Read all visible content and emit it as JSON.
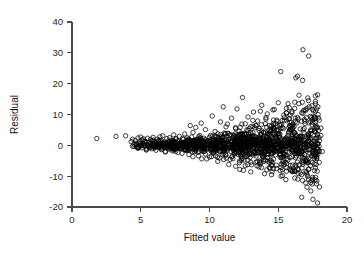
{
  "figure": {
    "background_color": "#ffffff",
    "marker_color": "#000000",
    "axis_color": "#4a4a4a",
    "marker_shape": "open-circle"
  },
  "axis_labels": {
    "x_title": "Fitted value",
    "y_title": "Residual"
  },
  "ticks": {
    "x": [
      "0",
      "5",
      "10",
      "15",
      "20"
    ],
    "y": [
      "40",
      "30",
      "20",
      "10",
      "0",
      "-10",
      "-20"
    ]
  },
  "chart_data": {
    "type": "scatter",
    "title": "",
    "xlabel": "Fitted value",
    "ylabel": "Residual",
    "xlim": [
      0,
      20
    ],
    "ylim": [
      -20,
      40
    ],
    "xticks": [
      0,
      5,
      10,
      15,
      20
    ],
    "yticks": [
      -20,
      -10,
      0,
      10,
      20,
      30,
      40
    ],
    "grid": false,
    "legend": "none",
    "marker": "open-circle",
    "marker_size": 2.2,
    "n_points": 1400,
    "points": [
      [
        1.8,
        2.2
      ],
      [
        3.2,
        2.9
      ],
      [
        3.9,
        3.1
      ],
      [
        4.3,
        1.2
      ],
      [
        4.4,
        2.0
      ],
      [
        4.5,
        -0.4
      ],
      [
        4.6,
        1.6
      ],
      [
        4.7,
        0.4
      ],
      [
        4.8,
        2.4
      ],
      [
        4.8,
        -1.0
      ],
      [
        4.9,
        1.1
      ],
      [
        5.0,
        0.2
      ],
      [
        5.0,
        2.7
      ],
      [
        5.1,
        -0.8
      ],
      [
        5.1,
        1.8
      ],
      [
        5.2,
        0.6
      ],
      [
        5.2,
        2.1
      ],
      [
        5.3,
        -0.2
      ],
      [
        5.3,
        1.4
      ],
      [
        5.4,
        0.9
      ],
      [
        5.4,
        -1.3
      ],
      [
        5.5,
        2.3
      ],
      [
        5.5,
        0.1
      ],
      [
        5.6,
        1.0
      ],
      [
        5.6,
        -0.6
      ],
      [
        5.7,
        1.9
      ],
      [
        5.7,
        0.5
      ],
      [
        5.8,
        -1.1
      ],
      [
        5.8,
        1.5
      ],
      [
        5.9,
        0.3
      ],
      [
        5.9,
        2.6
      ],
      [
        6.0,
        -0.9
      ],
      [
        6.0,
        1.2
      ],
      [
        6.1,
        0.7
      ],
      [
        6.1,
        -1.6
      ],
      [
        6.2,
        2.0
      ],
      [
        6.2,
        0.0
      ],
      [
        6.3,
        1.3
      ],
      [
        6.3,
        -0.5
      ],
      [
        6.4,
        2.8
      ],
      [
        6.4,
        0.8
      ],
      [
        6.5,
        -1.4
      ],
      [
        6.5,
        1.6
      ],
      [
        6.6,
        0.2
      ],
      [
        6.6,
        3.1
      ],
      [
        6.7,
        -0.7
      ],
      [
        6.7,
        1.1
      ],
      [
        6.8,
        0.4
      ],
      [
        6.8,
        -2.0
      ],
      [
        6.9,
        2.2
      ],
      [
        6.9,
        0.6
      ],
      [
        7.0,
        1.4
      ],
      [
        7.0,
        -1.2
      ],
      [
        7.1,
        0.1
      ],
      [
        7.1,
        2.5
      ],
      [
        7.2,
        -0.3
      ],
      [
        7.2,
        1.7
      ],
      [
        7.3,
        0.9
      ],
      [
        7.3,
        -1.8
      ],
      [
        7.4,
        3.4
      ],
      [
        7.4,
        0.3
      ],
      [
        7.5,
        1.2
      ],
      [
        7.5,
        -0.8
      ],
      [
        7.6,
        2.1
      ],
      [
        7.6,
        0.5
      ],
      [
        7.7,
        -2.3
      ],
      [
        7.7,
        1.5
      ],
      [
        7.8,
        0.0
      ],
      [
        7.8,
        2.9
      ],
      [
        7.9,
        -1.0
      ],
      [
        7.9,
        1.0
      ],
      [
        8.0,
        0.6
      ],
      [
        8.0,
        -2.6
      ],
      [
        8.1,
        1.9
      ],
      [
        8.1,
        0.2
      ],
      [
        8.2,
        3.7
      ],
      [
        8.2,
        -1.5
      ],
      [
        8.3,
        1.3
      ],
      [
        8.3,
        0.7
      ],
      [
        8.4,
        -0.4
      ],
      [
        8.4,
        2.4
      ],
      [
        8.5,
        0.1
      ],
      [
        8.5,
        -3.0
      ],
      [
        8.6,
        1.6
      ],
      [
        8.6,
        0.8
      ],
      [
        8.7,
        -1.1
      ],
      [
        8.7,
        2.7
      ],
      [
        8.8,
        0.3
      ],
      [
        8.8,
        4.2
      ],
      [
        8.9,
        -2.1
      ],
      [
        8.9,
        1.1
      ],
      [
        9.0,
        0.5
      ],
      [
        9.0,
        -0.6
      ],
      [
        9.1,
        2.0
      ],
      [
        9.1,
        0.9
      ],
      [
        9.2,
        -3.4
      ],
      [
        9.2,
        1.4
      ],
      [
        9.3,
        0.0
      ],
      [
        9.3,
        3.2
      ],
      [
        9.4,
        -1.7
      ],
      [
        9.4,
        1.8
      ],
      [
        9.5,
        0.4
      ],
      [
        9.5,
        -0.9
      ],
      [
        9.6,
        2.3
      ],
      [
        9.6,
        1.0
      ],
      [
        9.7,
        -2.8
      ],
      [
        9.7,
        5.1
      ],
      [
        9.8,
        0.6
      ],
      [
        9.8,
        -1.3
      ],
      [
        9.9,
        1.5
      ],
      [
        9.9,
        0.2
      ],
      [
        10.0,
        2.6
      ],
      [
        10.0,
        -3.8
      ],
      [
        10.1,
        1.2
      ],
      [
        10.1,
        0.7
      ],
      [
        10.2,
        -0.5
      ],
      [
        10.2,
        3.0
      ],
      [
        10.3,
        1.7
      ],
      [
        10.3,
        -2.2
      ],
      [
        10.4,
        0.3
      ],
      [
        10.4,
        4.5
      ],
      [
        10.5,
        1.1
      ],
      [
        10.5,
        -1.4
      ],
      [
        10.6,
        2.2
      ],
      [
        10.6,
        0.8
      ],
      [
        10.7,
        -4.1
      ],
      [
        10.7,
        1.6
      ],
      [
        10.8,
        0.1
      ],
      [
        10.8,
        3.5
      ],
      [
        10.9,
        -1.9
      ],
      [
        10.9,
        1.3
      ],
      [
        11.0,
        0.5
      ],
      [
        11.0,
        -0.7
      ],
      [
        11.1,
        2.8
      ],
      [
        11.1,
        1.0
      ],
      [
        11.2,
        -3.2
      ],
      [
        11.2,
        6.0
      ],
      [
        11.3,
        0.4
      ],
      [
        11.3,
        -1.6
      ],
      [
        11.4,
        1.9
      ],
      [
        11.4,
        0.2
      ],
      [
        11.5,
        3.3
      ],
      [
        11.5,
        -4.6
      ],
      [
        11.6,
        1.4
      ],
      [
        11.6,
        0.9
      ],
      [
        11.7,
        -0.8
      ],
      [
        11.7,
        2.5
      ],
      [
        11.8,
        1.6
      ],
      [
        11.8,
        -2.5
      ],
      [
        11.9,
        0.3
      ],
      [
        11.9,
        5.4
      ],
      [
        12.0,
        1.2
      ],
      [
        12.0,
        -1.2
      ],
      [
        12.1,
        2.1
      ],
      [
        12.1,
        0.6
      ],
      [
        12.2,
        -5.0
      ],
      [
        12.2,
        1.8
      ],
      [
        12.3,
        0.0
      ],
      [
        12.3,
        3.9
      ],
      [
        12.4,
        -2.0
      ],
      [
        12.4,
        1.3
      ],
      [
        12.5,
        0.7
      ],
      [
        12.5,
        -0.9
      ],
      [
        12.6,
        7.0
      ],
      [
        12.6,
        1.1
      ],
      [
        12.7,
        -3.6
      ],
      [
        12.7,
        2.4
      ],
      [
        12.8,
        0.4
      ],
      [
        12.8,
        -1.5
      ],
      [
        12.9,
        1.7
      ],
      [
        12.9,
        0.1
      ],
      [
        13.0,
        4.1
      ],
      [
        13.0,
        -5.5
      ],
      [
        13.1,
        1.5
      ],
      [
        13.1,
        0.8
      ],
      [
        13.2,
        -0.6
      ],
      [
        13.2,
        2.9
      ],
      [
        13.3,
        1.9
      ],
      [
        13.3,
        -2.7
      ],
      [
        13.4,
        0.2
      ],
      [
        13.4,
        6.3
      ],
      [
        13.5,
        1.0
      ],
      [
        13.5,
        -1.3
      ],
      [
        13.6,
        2.3
      ],
      [
        13.6,
        0.5
      ],
      [
        13.7,
        -6.0
      ],
      [
        13.7,
        1.6
      ],
      [
        13.8,
        0.0
      ],
      [
        13.8,
        4.7
      ],
      [
        13.9,
        -2.4
      ],
      [
        13.9,
        1.2
      ],
      [
        14.0,
        0.9
      ],
      [
        14.0,
        -1.0
      ],
      [
        14.1,
        8.5
      ],
      [
        14.1,
        1.4
      ],
      [
        14.2,
        -4.0
      ],
      [
        14.2,
        2.6
      ],
      [
        14.3,
        0.3
      ],
      [
        14.3,
        -1.8
      ],
      [
        14.4,
        1.8
      ],
      [
        14.4,
        0.6
      ],
      [
        14.5,
        5.2
      ],
      [
        14.5,
        -6.5
      ],
      [
        14.6,
        1.1
      ],
      [
        14.6,
        0.1
      ],
      [
        14.7,
        -0.7
      ],
      [
        14.7,
        3.4
      ],
      [
        14.8,
        2.0
      ],
      [
        14.8,
        -3.1
      ],
      [
        14.9,
        0.4
      ],
      [
        14.9,
        7.8
      ],
      [
        15.0,
        1.3
      ],
      [
        15.0,
        -1.6
      ],
      [
        15.1,
        2.7
      ],
      [
        15.1,
        0.8
      ],
      [
        15.2,
        -7.2
      ],
      [
        15.2,
        1.7
      ],
      [
        15.3,
        0.0
      ],
      [
        15.3,
        5.8
      ],
      [
        15.4,
        -2.9
      ],
      [
        15.4,
        1.5
      ],
      [
        15.5,
        0.5
      ],
      [
        15.5,
        -1.1
      ],
      [
        15.6,
        10.5
      ],
      [
        15.6,
        1.0
      ],
      [
        15.7,
        -4.8
      ],
      [
        15.7,
        3.1
      ],
      [
        15.8,
        0.2
      ],
      [
        15.8,
        -2.2
      ],
      [
        15.9,
        2.2
      ],
      [
        15.9,
        0.7
      ],
      [
        16.0,
        6.6
      ],
      [
        16.0,
        -8.0
      ],
      [
        16.1,
        1.2
      ],
      [
        16.1,
        -0.4
      ],
      [
        16.2,
        14.0
      ],
      [
        16.2,
        4.0
      ],
      [
        16.3,
        1.9
      ],
      [
        16.3,
        -3.5
      ],
      [
        16.4,
        0.3
      ],
      [
        16.4,
        9.0
      ],
      [
        16.5,
        1.4
      ],
      [
        16.5,
        -1.9
      ],
      [
        16.6,
        3.0
      ],
      [
        16.6,
        0.9
      ],
      [
        16.7,
        -9.5
      ],
      [
        16.7,
        2.0
      ],
      [
        16.8,
        31.0
      ],
      [
        16.8,
        5.0
      ],
      [
        16.9,
        -3.0
      ],
      [
        16.9,
        1.6
      ],
      [
        17.0,
        0.4
      ],
      [
        17.0,
        -1.4
      ],
      [
        17.1,
        12.0
      ],
      [
        17.1,
        1.1
      ],
      [
        17.2,
        -5.5
      ],
      [
        17.2,
        3.6
      ],
      [
        17.3,
        0.1
      ],
      [
        17.3,
        -2.6
      ],
      [
        17.4,
        2.4
      ],
      [
        17.4,
        0.8
      ],
      [
        17.5,
        7.5
      ],
      [
        17.5,
        -11.0
      ],
      [
        17.6,
        1.3
      ],
      [
        17.6,
        -0.6
      ],
      [
        17.7,
        16.0
      ],
      [
        17.7,
        4.4
      ],
      [
        17.8,
        2.1
      ],
      [
        17.8,
        -4.2
      ],
      [
        17.9,
        0.5
      ],
      [
        17.9,
        10.0
      ],
      [
        18.0,
        1.5
      ],
      [
        18.0,
        -13.5
      ],
      [
        18.1,
        3.2
      ],
      [
        18.1,
        5.6
      ],
      [
        18.2,
        -2.0
      ],
      [
        12.4,
        15.5
      ],
      [
        13.8,
        13.0
      ],
      [
        11.0,
        12.5
      ],
      [
        14.6,
        11.5
      ],
      [
        15.0,
        13.8
      ],
      [
        13.2,
        10.8
      ],
      [
        15.8,
        12.2
      ],
      [
        16.5,
        13.5
      ],
      [
        17.2,
        14.5
      ],
      [
        10.2,
        9.5
      ],
      [
        11.6,
        8.8
      ],
      [
        12.8,
        9.2
      ],
      [
        14.2,
        10.2
      ],
      [
        9.4,
        7.2
      ],
      [
        8.6,
        6.4
      ],
      [
        13.5,
        7.9
      ],
      [
        16.0,
        11.0
      ],
      [
        12.0,
        11.8
      ],
      [
        10.8,
        7.6
      ],
      [
        15.4,
        9.8
      ],
      [
        9.0,
        5.8
      ],
      [
        11.3,
        6.9
      ],
      [
        14.9,
        8.2
      ],
      [
        16.8,
        10.4
      ],
      [
        17.6,
        9.3
      ],
      [
        12.2,
        -7.8
      ],
      [
        13.0,
        -8.6
      ],
      [
        14.0,
        -9.2
      ],
      [
        15.2,
        -10.0
      ],
      [
        16.2,
        -10.6
      ],
      [
        11.4,
        -6.2
      ],
      [
        10.6,
        -5.2
      ],
      [
        17.0,
        -12.2
      ],
      [
        9.8,
        -4.4
      ],
      [
        13.6,
        -7.0
      ],
      [
        15.6,
        -8.4
      ],
      [
        16.6,
        -9.0
      ],
      [
        12.6,
        -6.6
      ],
      [
        14.4,
        -7.4
      ],
      [
        17.4,
        -11.4
      ]
    ]
  }
}
